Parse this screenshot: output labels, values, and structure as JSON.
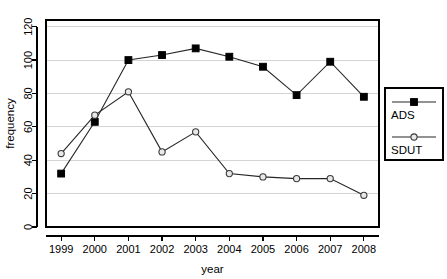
{
  "chart_data": {
    "type": "line",
    "title": "",
    "xlabel": "year",
    "ylabel": "frequency",
    "categories": [
      "1999",
      "2000",
      "2001",
      "2002",
      "2003",
      "2004",
      "2005",
      "2006",
      "2007",
      "2008"
    ],
    "x": [
      1999,
      2000,
      2001,
      2002,
      2003,
      2004,
      2005,
      2006,
      2007,
      2008
    ],
    "series": [
      {
        "name": "ADS",
        "marker": "filled-square",
        "color": "#000000",
        "values": [
          32,
          63,
          100,
          103,
          107,
          102,
          96,
          79,
          99,
          78
        ]
      },
      {
        "name": "SDUT",
        "marker": "open-circle",
        "color": "#000000",
        "values": [
          44,
          67,
          81,
          45,
          57,
          32,
          30,
          29,
          29,
          19
        ]
      }
    ],
    "xlim": [
      1998.55,
      2008.45
    ],
    "ylim": [
      0,
      124
    ],
    "yticks": [
      0,
      20,
      40,
      60,
      80,
      100,
      120
    ],
    "ytick_labels": [
      "0",
      "20",
      "40",
      "60",
      "80",
      "100",
      "120"
    ],
    "xtick_labels": [
      "1999",
      "2000",
      "2001",
      "2002",
      "2003",
      "2004",
      "2005",
      "2006",
      "2007",
      "2008"
    ],
    "grid": true,
    "grid_axis": "y",
    "grid_color": "#d4d4d4",
    "legend_position": "right-outside",
    "legend_entries": [
      "ADS",
      "SDUT"
    ]
  },
  "axes": {
    "y_title": "frequency",
    "x_title": "year"
  },
  "legend": {
    "entries": [
      {
        "label": "ADS",
        "marker": "filled-square-icon"
      },
      {
        "label": "SDUT",
        "marker": "open-circle-icon"
      }
    ]
  }
}
